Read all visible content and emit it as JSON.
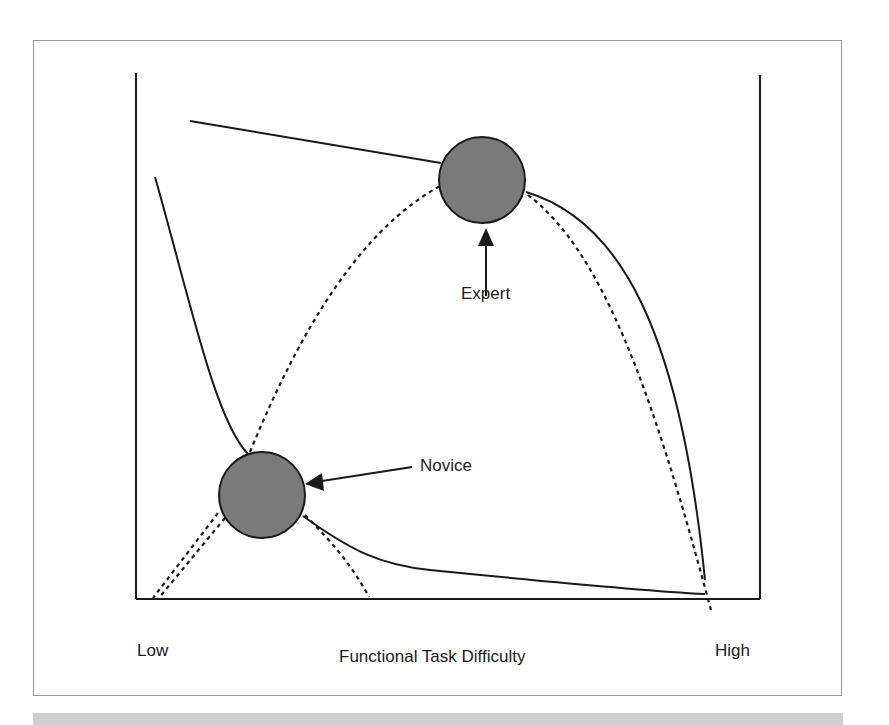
{
  "figure": {
    "x_axis": {
      "title": "Functional Task Difficulty",
      "low_label": "Low",
      "high_label": "High"
    },
    "annotations": {
      "expert_label": "Expert",
      "novice_label": "Novice"
    },
    "colors": {
      "line": "#1a1a1a",
      "circle_fill": "#7a7a7a",
      "frame_border": "#9a9a9a",
      "bottom_band": "#cfcfcf"
    },
    "nodes": [
      {
        "name": "Expert",
        "cx": 482,
        "cy": 180,
        "r": 43
      },
      {
        "name": "Novice",
        "cx": 262,
        "cy": 495,
        "r": 43
      }
    ]
  }
}
